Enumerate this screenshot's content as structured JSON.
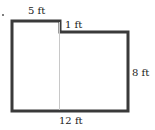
{
  "figure": {
    "type": "composite-rectangle",
    "colors": {
      "outline": "#3a3a3a",
      "divider": "#c8c8c8",
      "text": "#222222"
    },
    "labels": {
      "top_left": "5 ft",
      "step": "1 ft",
      "right": "8 ft",
      "bottom": "12 ft"
    },
    "dimensions_ft": {
      "top_left_width": 5,
      "step_height": 1,
      "right_height": 8,
      "bottom_width": 12
    }
  }
}
